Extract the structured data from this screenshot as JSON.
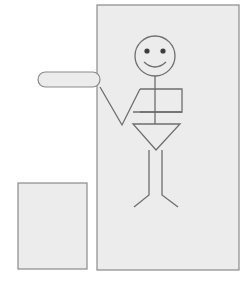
{
  "scene": {
    "title": "Stick figure with pointing arm inside panel",
    "width": 249,
    "height": 288,
    "background_color": "#ffffff"
  },
  "colors": {
    "panel_fill": "#ececec",
    "panel_stroke": "#8a8a8a",
    "figure_stroke": "#6e6e6e",
    "eye_fill": "#3d3d3d",
    "background": "#ffffff"
  },
  "shapes": {
    "main_panel": {
      "label": "main-panel",
      "x": 97,
      "y": 5,
      "width": 142,
      "height": 265,
      "fill": "#ececec",
      "stroke": "#8a8a8a"
    },
    "small_square": {
      "label": "small-square",
      "x": 18,
      "y": 183,
      "width": 69,
      "height": 86,
      "fill": "#ececec",
      "stroke": "#8a8a8a"
    },
    "pill": {
      "label": "pill-bar",
      "x": 38,
      "y": 72,
      "width": 62,
      "height": 15,
      "radius": 7.5,
      "fill": "#ececec",
      "stroke": "#8a8a8a"
    }
  },
  "figure": {
    "label": "stick-figure",
    "head": {
      "cx": 155,
      "cy": 56,
      "r": 20
    },
    "eye_left": {
      "cx": 147,
      "cy": 51,
      "r": 2.6
    },
    "eye_right": {
      "cx": 163,
      "cy": 51,
      "r": 2.6
    },
    "smile_path": "M 144 62 Q 155 72 166 62",
    "neck_path": "M 155 76 L 155 124",
    "torso_rect_path": "M 140 89 L 182 89 L 182 112 L 140 112",
    "shoulder_path": "M 140 89 L 122 125 L 100 87",
    "belt_path": "M 133 112 L 182 112",
    "skirt_path": "M 133 124 L 180 124 L 156 150 Z",
    "leg_left_path": "M 149 150 L 149 195 L 134 207",
    "leg_right_path": "M 162 150 L 162 195 L 178 207"
  },
  "legend": {
    "items": [
      {
        "name": "main-panel",
        "description": "Large light gray rectangle"
      },
      {
        "name": "small-square",
        "description": "Small light gray square lower left"
      },
      {
        "name": "pill-bar",
        "description": "Rounded horizontal capsule at left"
      },
      {
        "name": "stick-figure",
        "description": "Smiling stick figure with pointing arm"
      }
    ]
  }
}
